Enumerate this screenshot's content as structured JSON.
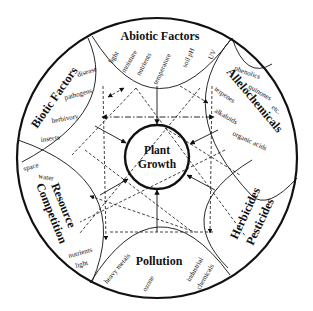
{
  "diagram": {
    "center": {
      "line1": "Plant",
      "line2": "Growth"
    },
    "sectors": {
      "abiotic": {
        "title": "Abiotic Factors",
        "items": [
          "light",
          "moisture",
          "nutrients",
          "temperature",
          "soil pH",
          "UV"
        ]
      },
      "allelochemicals": {
        "title": "Allelochemicals",
        "items": [
          "phenolics",
          "quinones",
          "etc.",
          "terpenes",
          "alkaloids",
          "organic acids"
        ]
      },
      "herbicides": {
        "title_line1": "Herbicides",
        "title_line2": "Pesticides"
      },
      "pollution": {
        "title": "Pollution",
        "items": [
          "heavy metals",
          "ozone",
          "industrial",
          "chemicals"
        ]
      },
      "resource": {
        "title_line1": "Resource",
        "title_line2": "Competition",
        "items": [
          "space",
          "water",
          "nutrients",
          "light"
        ]
      },
      "biotic": {
        "title": "Biotic Factors",
        "items": [
          "disease",
          "pathogens",
          "herbivory",
          "insects"
        ]
      }
    },
    "colors": {
      "ink": "#111111",
      "background": "#ffffff"
    }
  }
}
